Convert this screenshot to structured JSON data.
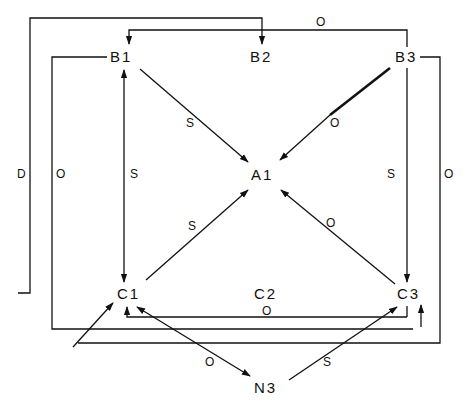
{
  "diagram": {
    "type": "directed-graph",
    "nodes": {
      "B1": {
        "label": "B1",
        "x": 125,
        "y": 57
      },
      "B2": {
        "label": "B2",
        "x": 262,
        "y": 57
      },
      "B3": {
        "label": "B3",
        "x": 400,
        "y": 57
      },
      "A1": {
        "label": "A1",
        "x": 262,
        "y": 175
      },
      "C1": {
        "label": "C1",
        "x": 125,
        "y": 293
      },
      "C2": {
        "label": "C2",
        "x": 262,
        "y": 293
      },
      "C3": {
        "label": "C3",
        "x": 400,
        "y": 293
      },
      "N3": {
        "label": "N3",
        "x": 262,
        "y": 387
      }
    },
    "edges": [
      {
        "from": "B1",
        "to": "A1",
        "label": "S"
      },
      {
        "from": "B3",
        "to": "A1",
        "label": "O"
      },
      {
        "from": "C1",
        "to": "A1",
        "label": "S"
      },
      {
        "from": "C3",
        "to": "A1",
        "label": "O"
      },
      {
        "from": "B1",
        "to": "C1",
        "label": "S",
        "bidirectional": true
      },
      {
        "from": "B3",
        "to": "C3",
        "label": "S"
      },
      {
        "from": "C1",
        "to": "B2",
        "label": "D",
        "route": "outer-left-top"
      },
      {
        "from": "B3",
        "to": "B1",
        "label": "O",
        "route": "top"
      },
      {
        "from": "B1",
        "to": "C3",
        "label": "O",
        "route": "left-bottom"
      },
      {
        "from": "B3",
        "to": "C1",
        "label": "O",
        "route": "right-bottom"
      },
      {
        "from": "C3",
        "to": "C1",
        "label": "O",
        "route": "bottom-horizontal"
      },
      {
        "from": "C1",
        "to": "N3",
        "label": "O",
        "bidirectional": true
      },
      {
        "from": "N3",
        "to": "C3",
        "label": "S"
      }
    ],
    "edge_labels": {
      "b1_a1": "S",
      "b3_a1": "O",
      "c1_a1": "S",
      "c3_a1": "O",
      "b1_c1": "S",
      "b3_c3": "S",
      "outer_left": "D",
      "inner_left": "O",
      "top": "O",
      "right": "O",
      "c3_c1": "O",
      "c1_n3": "O",
      "n3_c3": "S"
    },
    "colors": {
      "line": "#111111",
      "background": "#ffffff"
    }
  }
}
